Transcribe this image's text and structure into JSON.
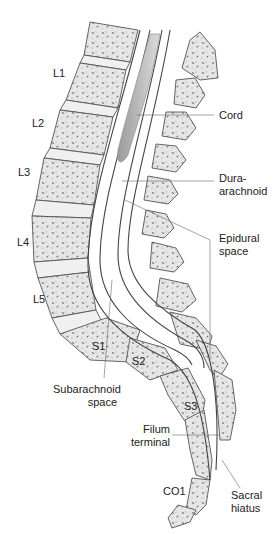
{
  "colors": {
    "bone": "#e6e6e6",
    "bone_stroke": "#555555",
    "disc": "#f0f0f0",
    "cord": "#b8b8b8",
    "dura": "#444444",
    "leader": "#666666",
    "text": "#222222"
  },
  "vertebra_labels": [
    "L1",
    "L2",
    "L3",
    "L4",
    "L5",
    "S1",
    "S2",
    "S3",
    "CO1"
  ],
  "labels": {
    "cord": "Cord",
    "dura_1": "Dura-",
    "dura_2": "arachnoid",
    "epidural_1": "Epidural",
    "epidural_2": "space",
    "subarachnoid_1": "Subarachnoid",
    "subarachnoid_2": "space",
    "filum_1": "Filum",
    "filum_2": "terminal",
    "sacral_1": "Sacral",
    "sacral_2": "hiatus"
  }
}
